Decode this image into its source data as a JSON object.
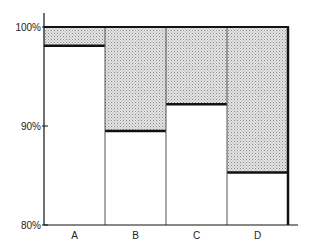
{
  "chart_data": {
    "type": "bar",
    "subtype": "stacked-100-percent",
    "title": "",
    "xlabel": "",
    "ylabel": "",
    "categories": [
      "A",
      "B",
      "C",
      "D"
    ],
    "series": [
      {
        "name": "lower",
        "fill": "#ffffff",
        "values": [
          98.1,
          89.5,
          92.2,
          85.3
        ]
      },
      {
        "name": "upper",
        "fill": "#cfcfcf",
        "pattern": "dotted",
        "values": [
          1.9,
          10.5,
          7.8,
          14.7
        ]
      }
    ],
    "ylim": [
      80,
      100
    ],
    "yticks": [
      80,
      90,
      100
    ],
    "ytick_labels": [
      "80%",
      "90%",
      "100%"
    ],
    "grid": false,
    "legend": "none",
    "colors": {
      "axis": "#111111",
      "divider": "#111111",
      "shade": "#cfcfcf"
    }
  }
}
